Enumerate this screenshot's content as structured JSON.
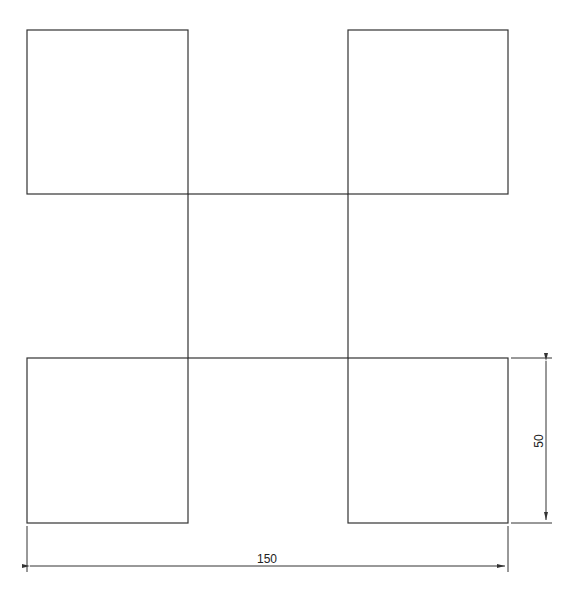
{
  "diagram": {
    "type": "technical-drawing",
    "colors": {
      "line": "#333333",
      "background": "#ffffff",
      "text": "#222222"
    },
    "squares": [
      {
        "name": "top-left",
        "x": 27,
        "y": 30,
        "w": 161,
        "h": 164
      },
      {
        "name": "top-right",
        "x": 348,
        "y": 30,
        "w": 160,
        "h": 164
      },
      {
        "name": "center",
        "x": 188,
        "y": 194,
        "w": 160,
        "h": 164
      },
      {
        "name": "bottom-left",
        "x": 27,
        "y": 358,
        "w": 161,
        "h": 165
      },
      {
        "name": "bottom-right",
        "x": 348,
        "y": 358,
        "w": 160,
        "h": 165
      }
    ],
    "dimensions": {
      "horizontal": {
        "label": "150"
      },
      "vertical": {
        "label": "50"
      }
    }
  }
}
